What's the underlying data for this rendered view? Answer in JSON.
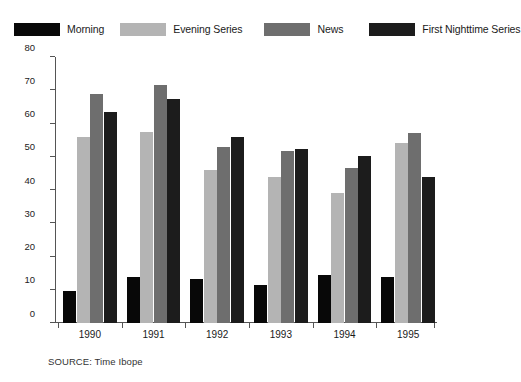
{
  "chart_data": {
    "type": "bar",
    "title": "",
    "subtitle": "",
    "xlabel": "",
    "ylabel": "",
    "categories": [
      "1990",
      "1991",
      "1992",
      "1993",
      "1994",
      "1995"
    ],
    "series": [
      {
        "name": "Morning",
        "color": "#080808",
        "values": [
          9.5,
          13.8,
          13.2,
          11.4,
          14.4,
          13.7
        ]
      },
      {
        "name": "Evening Series",
        "color": "#b4b4b4",
        "values": [
          56.0,
          57.3,
          46.0,
          43.8,
          39.2,
          54.2
        ]
      },
      {
        "name": "News",
        "color": "#6e6e6e",
        "values": [
          68.8,
          71.7,
          52.8,
          51.8,
          46.6,
          57.0
        ]
      },
      {
        "name": "First Nighttime Series",
        "color": "#1c1c1c",
        "values": [
          63.6,
          67.3,
          55.8,
          52.4,
          50.2,
          44.0
        ]
      }
    ],
    "ylim": [
      0,
      80
    ],
    "yticks": [
      0,
      10,
      20,
      30,
      40,
      50,
      60,
      70,
      80
    ],
    "ytick_labels": [
      "0",
      "10",
      "20",
      "30",
      "40",
      "50",
      "60",
      "70",
      "80"
    ],
    "grid": false,
    "legend_position": "top"
  },
  "legend": {
    "entries": [
      {
        "label": "Morning"
      },
      {
        "label": "Evening Series"
      },
      {
        "label": "News"
      },
      {
        "label": "First Nighttime Series"
      }
    ]
  },
  "source": {
    "text": "SOURCE: Time Ibope"
  }
}
